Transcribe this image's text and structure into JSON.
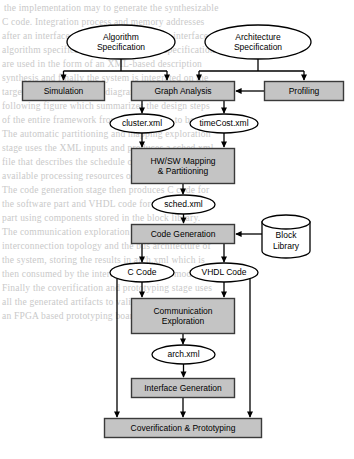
{
  "diagram": {
    "colors": {
      "process_fill": "#c4c4c4",
      "process_stroke": "#3a3a3a",
      "data_fill": "#ffffff",
      "data_stroke": "#000000",
      "arrow": "#000000",
      "background": "#ffffff",
      "bleed_text": "#c9c9c9"
    },
    "nodes": [
      {
        "id": "algorithm_spec",
        "shape": "ellipse",
        "label": "Algorithm\nSpecification",
        "x": 67,
        "y": 25,
        "w": 108,
        "h": 34
      },
      {
        "id": "architecture_spec",
        "shape": "ellipse",
        "label": "Architecture\nSpecification",
        "x": 205,
        "y": 25,
        "w": 106,
        "h": 34
      },
      {
        "id": "simulation",
        "shape": "process",
        "label": "Simulation",
        "x": 22,
        "y": 81,
        "w": 83,
        "h": 20
      },
      {
        "id": "graph_analysis",
        "shape": "process",
        "label": "Graph Analysis",
        "x": 131,
        "y": 81,
        "w": 104,
        "h": 20
      },
      {
        "id": "profiling",
        "shape": "process",
        "label": "Profiling",
        "x": 264,
        "y": 81,
        "w": 80,
        "h": 20
      },
      {
        "id": "cluster_xml",
        "shape": "ellipse",
        "label": "cluster.xml",
        "x": 110,
        "y": 114,
        "w": 64,
        "h": 19
      },
      {
        "id": "timecost_xml",
        "shape": "ellipse",
        "label": "timeCost.xml",
        "x": 190,
        "y": 114,
        "w": 68,
        "h": 19
      },
      {
        "id": "hwsw_mapping",
        "shape": "process",
        "label": "HW/SW Mapping\n& Partitioning",
        "x": 131,
        "y": 148,
        "w": 104,
        "h": 36
      },
      {
        "id": "sched_xml",
        "shape": "ellipse",
        "label": "sched.xml",
        "x": 152,
        "y": 195,
        "w": 63,
        "h": 19
      },
      {
        "id": "code_generation",
        "shape": "process",
        "label": "Code Generation",
        "x": 131,
        "y": 224,
        "w": 104,
        "h": 20
      },
      {
        "id": "block_library",
        "shape": "cylinder",
        "label": "Block\nLibrary",
        "x": 262,
        "y": 215,
        "w": 48,
        "h": 43
      },
      {
        "id": "c_code",
        "shape": "ellipse",
        "label": "C Code",
        "x": 110,
        "y": 263,
        "w": 64,
        "h": 19
      },
      {
        "id": "vhdl_code",
        "shape": "ellipse",
        "label": "VHDL Code",
        "x": 190,
        "y": 263,
        "w": 68,
        "h": 19
      },
      {
        "id": "communication_expl",
        "shape": "process",
        "label": "Communication\nExploration",
        "x": 131,
        "y": 298,
        "w": 104,
        "h": 36
      },
      {
        "id": "arch_xml",
        "shape": "ellipse",
        "label": "arch.xml",
        "x": 152,
        "y": 345,
        "w": 63,
        "h": 19
      },
      {
        "id": "interface_generation",
        "shape": "process",
        "label": "Interface Generation",
        "x": 131,
        "y": 378,
        "w": 104,
        "h": 20
      },
      {
        "id": "coverification",
        "shape": "process",
        "label": "Coverification & Prototyping",
        "x": 104,
        "y": 418,
        "w": 158,
        "h": 20
      }
    ],
    "edges": [
      {
        "from": "algorithm_spec",
        "to": "simulation",
        "kind": "branch"
      },
      {
        "from": "algorithm_spec",
        "to": "graph_analysis",
        "kind": "branch"
      },
      {
        "from": "architecture_spec",
        "to": "graph_analysis",
        "kind": "branch"
      },
      {
        "from": "architecture_spec",
        "to": "profiling",
        "kind": "branch"
      },
      {
        "from": "profiling",
        "to": "graph_analysis",
        "kind": "horizontal"
      },
      {
        "from": "graph_analysis",
        "to": "cluster_xml",
        "kind": "branch"
      },
      {
        "from": "graph_analysis",
        "to": "timecost_xml",
        "kind": "branch"
      },
      {
        "from": "cluster_xml",
        "to": "hwsw_mapping",
        "kind": "vertical"
      },
      {
        "from": "timecost_xml",
        "to": "hwsw_mapping",
        "kind": "vertical"
      },
      {
        "from": "hwsw_mapping",
        "to": "sched_xml",
        "kind": "vertical"
      },
      {
        "from": "sched_xml",
        "to": "code_generation",
        "kind": "vertical"
      },
      {
        "from": "block_library",
        "to": "code_generation",
        "kind": "horizontal"
      },
      {
        "from": "code_generation",
        "to": "c_code",
        "kind": "branch"
      },
      {
        "from": "code_generation",
        "to": "vhdl_code",
        "kind": "branch"
      },
      {
        "from": "c_code",
        "to": "communication_expl",
        "kind": "vertical"
      },
      {
        "from": "vhdl_code",
        "to": "communication_expl",
        "kind": "vertical"
      },
      {
        "from": "c_code",
        "to": "coverification",
        "kind": "bypass-left"
      },
      {
        "from": "vhdl_code",
        "to": "coverification",
        "kind": "bypass-right"
      },
      {
        "from": "communication_expl",
        "to": "arch_xml",
        "kind": "vertical"
      },
      {
        "from": "arch_xml",
        "to": "interface_generation",
        "kind": "vertical"
      },
      {
        "from": "interface_generation",
        "to": "coverification",
        "kind": "vertical"
      }
    ]
  },
  "bleed_text": {
    "lines": [
      {
        "text": "the implementation may    to generate the synthesizable",
        "x": 4,
        "y": 3
      },
      {
        "text": "C code.  Integration process and memory addresses",
        "x": 2,
        "y": 17
      },
      {
        "text": "after an interface synthesis to generate the interface",
        "x": 2,
        "y": 31
      },
      {
        "text": "algorithm specification and architecture specification",
        "x": 2,
        "y": 45
      },
      {
        "text": "are used in the form of an XML-based description",
        "x": 2,
        "y": 59
      },
      {
        "text": "synthesis and finally the system is integrated on the",
        "x": 2,
        "y": 73
      },
      {
        "text": "target platform. The flow diagram is presented in the",
        "x": 2,
        "y": 87
      },
      {
        "text": "following figure which summarizes the design steps",
        "x": 2,
        "y": 101
      },
      {
        "text": "of the entire framework from specification to board.",
        "x": 2,
        "y": 115
      },
      {
        "text": "The automatic partitioning and mapping exploration",
        "x": 2,
        "y": 129
      },
      {
        "text": "stage uses the XML inputs and produces a sched.xml",
        "x": 2,
        "y": 143
      },
      {
        "text": "file that describes the schedule of each task on the",
        "x": 2,
        "y": 157
      },
      {
        "text": "available processing resources of the architecture.",
        "x": 2,
        "y": 171
      },
      {
        "text": "The code generation stage then produces C code for",
        "x": 2,
        "y": 185
      },
      {
        "text": "the software part and VHDL code for the hardware",
        "x": 2,
        "y": 199
      },
      {
        "text": "part using components stored in the block library.",
        "x": 2,
        "y": 213
      },
      {
        "text": "The communication exploration step determines the",
        "x": 2,
        "y": 227
      },
      {
        "text": "interconnection topology and the bus architecture of",
        "x": 2,
        "y": 241
      },
      {
        "text": "the system, storing the results in arch.xml which is",
        "x": 2,
        "y": 255
      },
      {
        "text": "then consumed by the interface generation module.",
        "x": 2,
        "y": 269
      },
      {
        "text": "Finally the coverification and prototyping stage uses",
        "x": 2,
        "y": 283
      },
      {
        "text": "all the generated artifacts to validate the design on",
        "x": 2,
        "y": 297
      },
      {
        "text": "an FPGA based prototyping board before tape-out.",
        "x": 2,
        "y": 311
      }
    ]
  }
}
